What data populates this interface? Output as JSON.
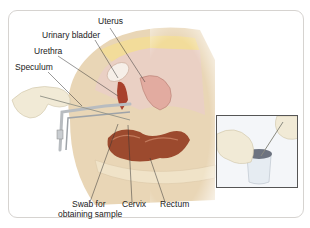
{
  "figure": {
    "main_panel": {
      "subject": "speculum-examination-cross-section",
      "labels": [
        {
          "id": "uterus",
          "text": "Uterus"
        },
        {
          "id": "urinary_bladder",
          "text": "Urinary bladder"
        },
        {
          "id": "urethra",
          "text": "Urethra"
        },
        {
          "id": "speculum",
          "text": "Speculum"
        },
        {
          "id": "swab_line1",
          "text": "Swab for"
        },
        {
          "id": "swab_line2",
          "text": "obtaining sample"
        },
        {
          "id": "cervix",
          "text": "Cervix"
        },
        {
          "id": "rectum",
          "text": "Rectum"
        }
      ]
    },
    "inset_panel": {
      "subject": "swab-placed-in-sample-container"
    },
    "colors": {
      "frame_border": "#d6d3d0",
      "skin": "#e9d6b6",
      "tissue_pink": "#e7b9ad",
      "organ_red": "#a8402c",
      "glove": "#eee9d8",
      "steel": "#b8bcc0",
      "leader_line": "#333333"
    }
  }
}
